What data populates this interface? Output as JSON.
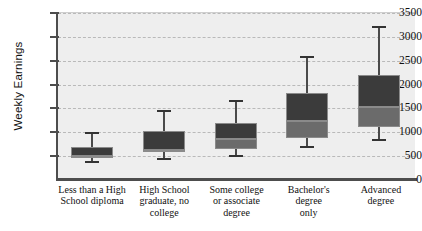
{
  "chart_data": {
    "type": "box",
    "title": "",
    "xlabel": "",
    "ylabel": "Weekly Earnings",
    "ylim": [
      0,
      3500
    ],
    "yticks": [
      0,
      500,
      1000,
      1500,
      2000,
      2500,
      3000,
      3500
    ],
    "ytick_labels": [
      "0",
      "500",
      "1000",
      "1500",
      "2000",
      "2500",
      "3000",
      "3500"
    ],
    "grid": true,
    "legend": "none",
    "categories": [
      "Less than a High School diploma",
      "High School graduate, no college",
      "Some college or associate degree",
      "Bachelor's degree only",
      "Advanced degree"
    ],
    "category_lines": [
      [
        "Less than a High",
        "School diploma"
      ],
      [
        "High School",
        "graduate, no",
        "college"
      ],
      [
        "Some college",
        "or associate",
        "degree"
      ],
      [
        "Bachelor's degree",
        "only"
      ],
      [
        "Advanced",
        "degree"
      ]
    ],
    "boxes": [
      {
        "category": "Less than a High School diploma",
        "min": 350,
        "q1": 470,
        "median": 500,
        "q3": 700,
        "max": 1010
      },
      {
        "category": "High School graduate, no college",
        "min": 420,
        "q1": 580,
        "median": 620,
        "q3": 1030,
        "max": 1460
      },
      {
        "category": "Some college or associate degree",
        "min": 480,
        "q1": 650,
        "median": 850,
        "q3": 1200,
        "max": 1670
      },
      {
        "category": "Bachelor's degree only",
        "min": 680,
        "q1": 880,
        "median": 1240,
        "q3": 1830,
        "max": 2600
      },
      {
        "category": "Advanced degree",
        "min": 820,
        "q1": 1110,
        "median": 1540,
        "q3": 2200,
        "max": 3230
      }
    ],
    "colors": {
      "box_upper": "#3b3b3b",
      "box_lower": "#6b6b6b",
      "plot_background": "#eeeeee",
      "axis": "#4d4d4d",
      "gridline": "#b9b9b9",
      "whisker": "#4a4a4a"
    }
  }
}
